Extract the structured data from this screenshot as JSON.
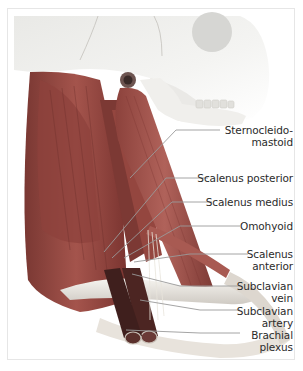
{
  "figure": {
    "colors": {
      "muscle": "#9b4b44",
      "muscle_dark": "#6e2e2a",
      "bone": "#eeeeea",
      "bone_shadow": "#c9c7c2",
      "vessel": "#5a2a2a",
      "leader_line": "#9a9a9a",
      "text": "#2b2b2b"
    },
    "labels": [
      {
        "id": "sternocleidomastoid",
        "line1": "Sternocleido-",
        "line2": "mastoid"
      },
      {
        "id": "scalenus-posterior",
        "line1": "Scalenus posterior",
        "line2": ""
      },
      {
        "id": "scalenus-medius",
        "line1": "Scalenus medius",
        "line2": ""
      },
      {
        "id": "omohyoid",
        "line1": "Omohyoid",
        "line2": ""
      },
      {
        "id": "scalenus-anterior",
        "line1": "Scalenus",
        "line2": "anterior"
      },
      {
        "id": "subclavian-vein",
        "line1": "Subclavian",
        "line2": "vein"
      },
      {
        "id": "subclavian-artery",
        "line1": "Subclavian",
        "line2": "artery"
      },
      {
        "id": "brachial-plexus",
        "line1": "Brachial",
        "line2": "plexus"
      }
    ]
  }
}
